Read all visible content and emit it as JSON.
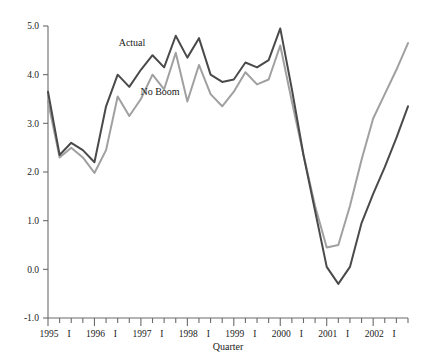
{
  "chart_data": {
    "type": "line",
    "title": "",
    "xlabel": "Quarter",
    "ylabel": "",
    "ylim": [
      -1.0,
      5.0
    ],
    "ytick_values": [
      -1.0,
      0.0,
      1.0,
      2.0,
      3.0,
      4.0,
      5.0
    ],
    "ytick_labels": [
      "-1.0",
      "0.0",
      "1.0",
      "2.0",
      "3.0",
      "4.0",
      "5.0"
    ],
    "grid": false,
    "legend_position": "inline-annotation",
    "x": [
      "1995 I",
      "1995 II",
      "1995 III",
      "1995 IV",
      "1996 I",
      "1996 II",
      "1996 III",
      "1996 IV",
      "1997 I",
      "1997 II",
      "1997 III",
      "1997 IV",
      "1998 I",
      "1998 II",
      "1998 III",
      "1998 IV",
      "1999 I",
      "1999 II",
      "1999 III",
      "1999 IV",
      "2000 I",
      "2000 II",
      "2000 III",
      "2000 IV",
      "2001 I",
      "2001 II",
      "2001 III",
      "2001 IV",
      "2002 I",
      "2002 II",
      "2002 III",
      "2002 IV"
    ],
    "xtick_labels": [
      "1995",
      "I",
      "1996",
      "I",
      "1997",
      "I",
      "1998",
      "I",
      "1999",
      "I",
      "2000",
      "I",
      "2001",
      "I",
      "2002",
      "I"
    ],
    "xtick_major_index": [
      0,
      4,
      8,
      12,
      16,
      20,
      24,
      28
    ],
    "series": [
      {
        "name": "Actual",
        "color": "#4a4a4a",
        "values": [
          3.65,
          2.35,
          2.6,
          2.45,
          2.2,
          3.35,
          4.0,
          3.75,
          4.1,
          4.4,
          4.15,
          4.8,
          4.35,
          4.75,
          4.0,
          3.85,
          3.9,
          4.25,
          4.15,
          4.3,
          4.95,
          3.7,
          2.35,
          1.2,
          0.05,
          -0.3,
          0.05,
          0.95,
          1.55,
          2.1,
          2.7,
          3.35
        ]
      },
      {
        "name": "No Boom",
        "color": "#a0a0a0",
        "values": [
          3.45,
          2.3,
          2.5,
          2.3,
          1.98,
          2.45,
          3.55,
          3.15,
          3.5,
          4.0,
          3.7,
          4.45,
          3.45,
          4.2,
          3.6,
          3.35,
          3.65,
          4.05,
          3.8,
          3.9,
          4.6,
          3.45,
          2.35,
          1.3,
          0.45,
          0.5,
          1.3,
          2.25,
          3.1,
          3.6,
          4.1,
          4.65
        ]
      }
    ],
    "annotations": [
      {
        "text": "Actual",
        "x_px": 132,
        "y_px": 46
      },
      {
        "text": "No Boom",
        "x_px": 160,
        "y_px": 95
      }
    ]
  }
}
